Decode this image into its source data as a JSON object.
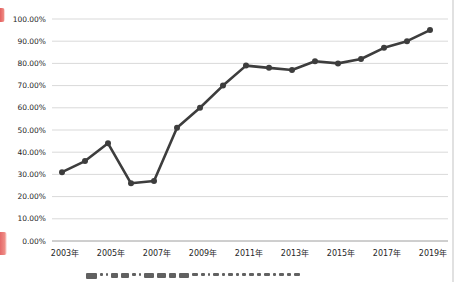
{
  "page": {
    "background": "#ffffff",
    "kind": "scanned-line-chart"
  },
  "chart_data": {
    "type": "line",
    "title": "",
    "xlabel": "",
    "ylabel": "",
    "x": [
      2003,
      2004,
      2005,
      2006,
      2007,
      2008,
      2009,
      2010,
      2011,
      2012,
      2013,
      2014,
      2015,
      2016,
      2017,
      2018,
      2019
    ],
    "series": [
      {
        "name": "",
        "values": [
          31,
          36,
          44,
          26,
          27,
          51,
          60,
          70,
          79,
          78,
          77,
          81,
          80,
          82,
          87,
          90,
          95
        ]
      }
    ],
    "ylim": [
      0,
      100
    ],
    "y_tick_labels_top_to_bottom": [
      "100.00%",
      "90.00%",
      "80.00%",
      "70.00%",
      "60.00%",
      "50.00%",
      "40.00%",
      "30.00%",
      "20.00%",
      "10.00%",
      "0.00%"
    ],
    "x_tick_labels": [
      "2003年",
      "2005年",
      "2007年",
      "2009年",
      "2011年",
      "2013年",
      "2015年",
      "2017年",
      "2019年"
    ],
    "grid": true,
    "legend": false,
    "line_color": "#3d3d3d",
    "marker": "circle",
    "gridline_color": "#d9d9d9",
    "axis_line_color": "#9e9e9e",
    "tick_label_color": "#262626"
  },
  "artifacts": {
    "left_edge_mark_color": "#e04f4f",
    "right_edge_line_color": "#dcdcdc",
    "caption_mark_widths": [
      11,
      3,
      2,
      7,
      8,
      4,
      2,
      10,
      9,
      7,
      10,
      6,
      4,
      2,
      6,
      3,
      5,
      3,
      4,
      5,
      4,
      6,
      3,
      5,
      4,
      6
    ]
  }
}
